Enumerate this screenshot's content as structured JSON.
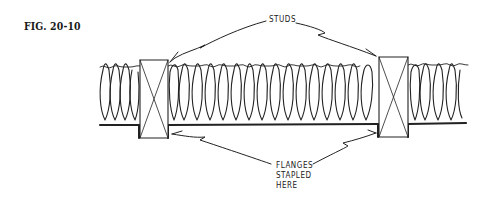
{
  "figure": {
    "label": "FIG. 20-10"
  },
  "callouts": {
    "studs": "STUDS",
    "flanges": [
      "FLANGES",
      "STAPLED",
      "HERE"
    ]
  },
  "diagram": {
    "elements": [
      {
        "name": "left-stud",
        "symbol": "boxed X (cross-section of wood stud)"
      },
      {
        "name": "right-stud",
        "symbol": "boxed X (cross-section of wood stud)"
      },
      {
        "name": "insulation-batt",
        "symbol": "looped fiberglass pattern"
      },
      {
        "name": "vapor-barrier-flange",
        "symbol": "heavy line stapled to stud faces"
      }
    ],
    "colors": {
      "ink": "#222222",
      "background": "#ffffff"
    }
  }
}
